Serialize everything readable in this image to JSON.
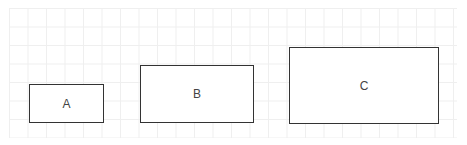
{
  "diagram": {
    "shapes": [
      {
        "id": "A",
        "label": "A",
        "type": "rectangle"
      },
      {
        "id": "B",
        "label": "B",
        "type": "rectangle"
      },
      {
        "id": "C",
        "label": "C",
        "type": "rectangle"
      }
    ],
    "background": "grid",
    "colors": {
      "stroke": "#333333",
      "fill": "#ffffff",
      "grid": "#efefef",
      "text": "#444444"
    }
  }
}
